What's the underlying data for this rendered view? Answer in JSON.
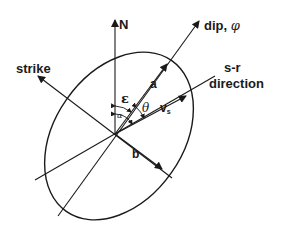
{
  "diagram": {
    "labels": {
      "north": "N",
      "dip": "dip, ",
      "phi": "φ",
      "strike": "strike",
      "sr_line1": "s-r",
      "sr_line2": "direction",
      "semi_major": "a",
      "semi_minor": "b",
      "velocity": "v",
      "velocity_sub": "s",
      "epsilon": "ε",
      "theta": "θ",
      "alpha": "α"
    },
    "colors": {
      "stroke": "#1a1a1a",
      "background": "#ffffff"
    }
  }
}
